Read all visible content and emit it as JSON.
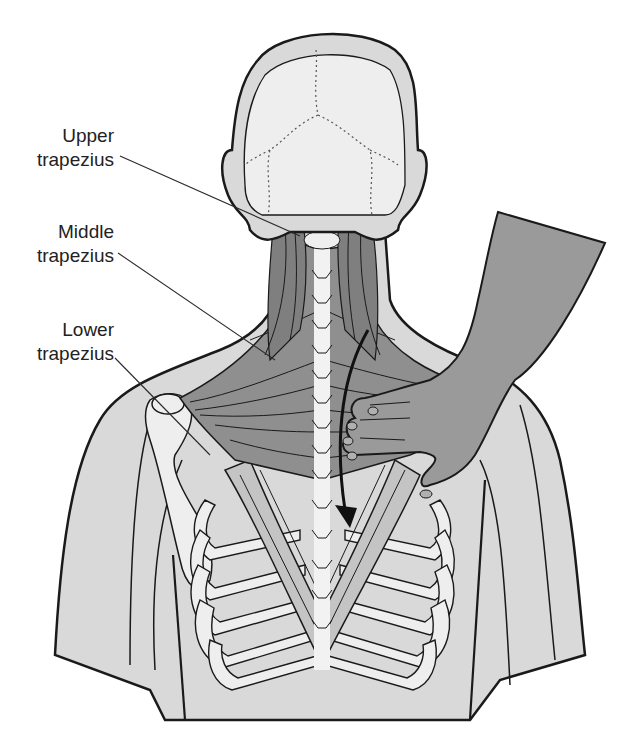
{
  "figure": {
    "colors": {
      "background": "#ffffff",
      "skin_outer": "#d9d9d9",
      "bone": "#eeeeee",
      "muscle": "#8f8f8f",
      "muscle_light": "#b5b5b5",
      "hand": "#9a9a9a",
      "outline": "#1a1a1a",
      "arrow": "#111111"
    }
  },
  "labels": [
    {
      "id": "upper",
      "line1": "Upper",
      "line2": "trapezius"
    },
    {
      "id": "middle",
      "line1": "Middle",
      "line2": "trapezius"
    },
    {
      "id": "lower",
      "line1": "Lower",
      "line2": "trapezius"
    }
  ],
  "annotations": {
    "arrow": "curved-arrow-down-direction-of-palpation"
  }
}
